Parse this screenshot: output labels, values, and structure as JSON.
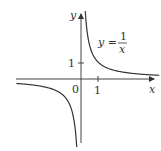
{
  "chart_data": {
    "type": "line",
    "title": "",
    "function": "y = 1/x",
    "annotation": {
      "text_lhs": "y =",
      "numerator": "1",
      "denominator": "x"
    },
    "xlabel": "x",
    "ylabel": "y",
    "origin_label": "0",
    "x_ticks": [
      {
        "value": 1,
        "label": "1"
      }
    ],
    "y_ticks": [
      {
        "value": 1,
        "label": "1"
      }
    ],
    "xlim": [
      -4.5,
      4.8
    ],
    "ylim": [
      -4.5,
      4.0
    ],
    "grid": false,
    "series": [
      {
        "name": "y=1/x (x>0)",
        "x": [
          0.25,
          0.3,
          0.4,
          0.5,
          0.75,
          1,
          1.5,
          2,
          3,
          4,
          4.6
        ],
        "y": [
          4,
          3.33,
          2.5,
          2,
          1.33,
          1,
          0.67,
          0.5,
          0.33,
          0.25,
          0.22
        ]
      },
      {
        "name": "y=1/x (x<0)",
        "x": [
          -4.6,
          -4,
          -3,
          -2,
          -1.5,
          -1,
          -0.75,
          -0.5,
          -0.4,
          -0.3,
          -0.25
        ],
        "y": [
          -0.22,
          -0.25,
          -0.33,
          -0.5,
          -0.67,
          -1,
          -1.33,
          -2,
          -2.5,
          -3.33,
          -4
        ]
      }
    ]
  }
}
